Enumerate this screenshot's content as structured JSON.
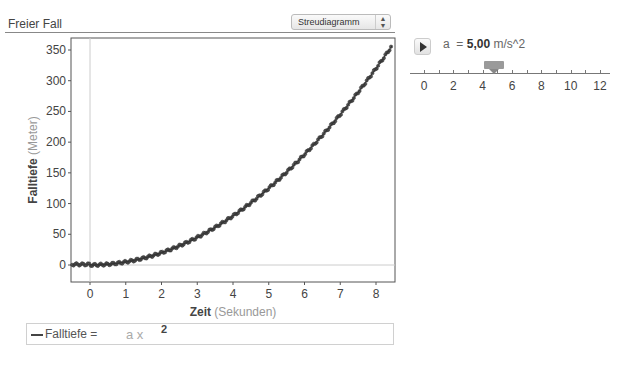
{
  "header": {
    "title": "Freier Fall",
    "chart_type_select": "Streudiagramm"
  },
  "legend": {
    "label": "Falltiefe =",
    "formula": "a x",
    "exponent": "2"
  },
  "parameter": {
    "name": "a",
    "equals": "=",
    "value": "5,00",
    "unit": "m/s^2",
    "slider": {
      "min": 0,
      "max": 12,
      "value": 5,
      "ticks": [
        "0",
        "2",
        "4",
        "6",
        "8",
        "10",
        "12"
      ]
    }
  },
  "chart_data": {
    "type": "scatter",
    "title": "Freier Fall",
    "xlabel": "Zeit",
    "xlabel_unit": "(Sekunden)",
    "ylabel": "Falltiefe",
    "ylabel_unit": "(Meter)",
    "xlim": [
      -0.5,
      8.5
    ],
    "ylim": [
      -30,
      370
    ],
    "x_ticks": [
      "0",
      "1",
      "2",
      "3",
      "4",
      "5",
      "6",
      "7",
      "8"
    ],
    "y_ticks": [
      "0",
      "50",
      "100",
      "150",
      "200",
      "250",
      "300",
      "350"
    ],
    "grid": false,
    "series": [
      {
        "name": "Messwerte",
        "type": "scatter",
        "x": [
          -0.5,
          0,
          0.5,
          1,
          1.5,
          2,
          2.5,
          3,
          3.5,
          4,
          4.5,
          5,
          5.5,
          6,
          6.5,
          7,
          7.5,
          8,
          8.4
        ],
        "values": [
          0,
          0,
          1.25,
          5,
          11.25,
          20,
          31.25,
          45,
          61.25,
          80,
          101.25,
          125,
          151.25,
          180,
          211.25,
          245,
          281.25,
          320,
          352.8
        ]
      },
      {
        "name": "Falltiefe = a x^2",
        "type": "line",
        "a": 5.0
      }
    ]
  }
}
